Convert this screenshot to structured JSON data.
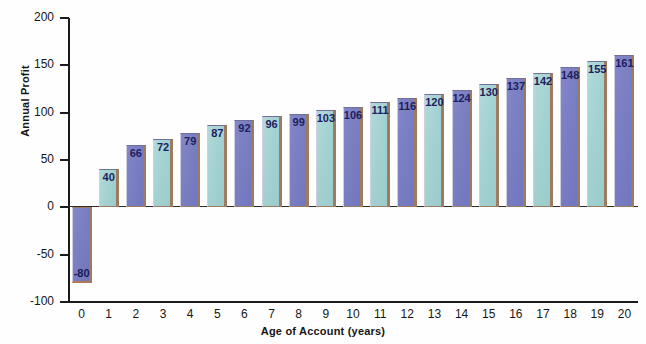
{
  "chart_data": {
    "type": "bar",
    "title": "",
    "xlabel": "Age of Account (years)",
    "ylabel": "Annual Profit",
    "categories": [
      "0",
      "1",
      "2",
      "3",
      "4",
      "5",
      "6",
      "7",
      "8",
      "9",
      "10",
      "11",
      "12",
      "13",
      "14",
      "15",
      "16",
      "17",
      "18",
      "19",
      "20"
    ],
    "values": [
      -80,
      40,
      66,
      72,
      79,
      87,
      92,
      96,
      99,
      103,
      106,
      111,
      116,
      120,
      124,
      130,
      137,
      142,
      148,
      155,
      161
    ],
    "data_labels": [
      "-80",
      "40",
      "66",
      "72",
      "79",
      "87",
      "92",
      "96",
      "99",
      "103",
      "106",
      "111",
      "116",
      "120",
      "124",
      "130",
      "137",
      "142",
      "148",
      "155",
      "161"
    ],
    "ylim": [
      -100,
      200
    ],
    "xlim": [
      -0.5,
      20.5
    ],
    "y_ticks": [
      -100,
      -50,
      0,
      50,
      100,
      150,
      200
    ],
    "y_tick_labels": [
      "-100",
      "-50",
      "0",
      "50",
      "100",
      "150",
      "200"
    ],
    "grid": false,
    "legend": false,
    "series": [
      {
        "name": "Annual Profit",
        "values": [
          -80,
          40,
          66,
          72,
          79,
          87,
          92,
          96,
          99,
          103,
          106,
          111,
          116,
          120,
          124,
          130,
          137,
          142,
          148,
          155,
          161
        ]
      }
    ],
    "bar_colors": [
      "purple",
      "teal",
      "purple",
      "teal",
      "purple",
      "teal",
      "purple",
      "teal",
      "purple",
      "teal",
      "purple",
      "teal",
      "purple",
      "teal",
      "purple",
      "teal",
      "purple",
      "teal",
      "purple",
      "teal",
      "purple"
    ],
    "colors": {
      "purple": "#7a7ec2",
      "teal": "#a4d2d2",
      "bar_edge": "#9d7b5f",
      "axis": "#1b1b1b",
      "label_text": "#1d2060",
      "background": "#ffffff"
    }
  }
}
